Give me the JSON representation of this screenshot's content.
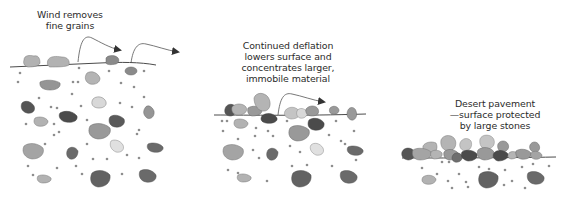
{
  "diagram": {
    "colors": {
      "ground_line": "#4a4a4a",
      "arrow": "#444444",
      "grain": "#8e8e8e",
      "stone_light": "#d8d8d8",
      "stone_mid_light": "#b4b4b4",
      "stone_mid": "#9a9a9a",
      "stone_dark": "#6e6e6e",
      "stone_darkest": "#4a4a4a"
    },
    "panels": [
      {
        "id": "panel-1",
        "label": "Wind removes\nfine grains",
        "label_pos": {
          "x": 20,
          "y": 9,
          "w": 100
        }
      },
      {
        "id": "panel-2",
        "label": "Continued deflation\nlowers surface and\nconcentrates larger,\nimmobile material",
        "label_pos": {
          "x": 228,
          "y": 40,
          "w": 120
        }
      },
      {
        "id": "panel-3",
        "label": "Desert pavement\n—surface protected\nby large stones",
        "label_pos": {
          "x": 440,
          "y": 98,
          "w": 110
        }
      }
    ]
  }
}
